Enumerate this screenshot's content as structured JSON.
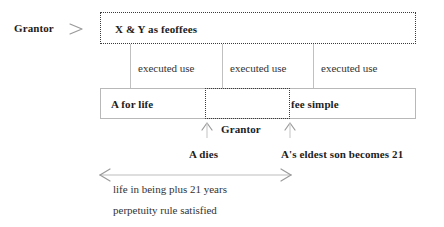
{
  "diagram": {
    "title_note": "Legal estates diagram - executed uses and perpetuity rule",
    "grantor_left_label": "Grantor",
    "feoffees_box_label": "X & Y as feoffees",
    "executed_use_cells": [
      {
        "label": "executed use"
      },
      {
        "label": "executed use"
      },
      {
        "label": "executed use"
      }
    ],
    "estate_cells": [
      {
        "label": "A for life"
      },
      {
        "label": ""
      },
      {
        "label": "fee simple"
      }
    ],
    "grantor_middle_label": "Grantor",
    "event_labels": [
      {
        "label": "A dies"
      },
      {
        "label": "A's eldest son becomes 21"
      }
    ],
    "span_captions": [
      {
        "label": "life in being plus 21 years"
      },
      {
        "label": "perpetuity rule satisfied"
      }
    ],
    "icons": {
      "right_arrow": "arrow-right-icon",
      "up_arrow_left": "arrow-up-icon",
      "up_arrow_right": "arrow-up-icon",
      "span_arrow": "double-arrow-horizontal-icon"
    },
    "colors": {
      "text": "#1d1d1d",
      "line_solid": "#b8b8b8",
      "line_dotted": "#3a3a3a",
      "arrow": "#9a9a9a",
      "background": "#ffffff"
    }
  }
}
